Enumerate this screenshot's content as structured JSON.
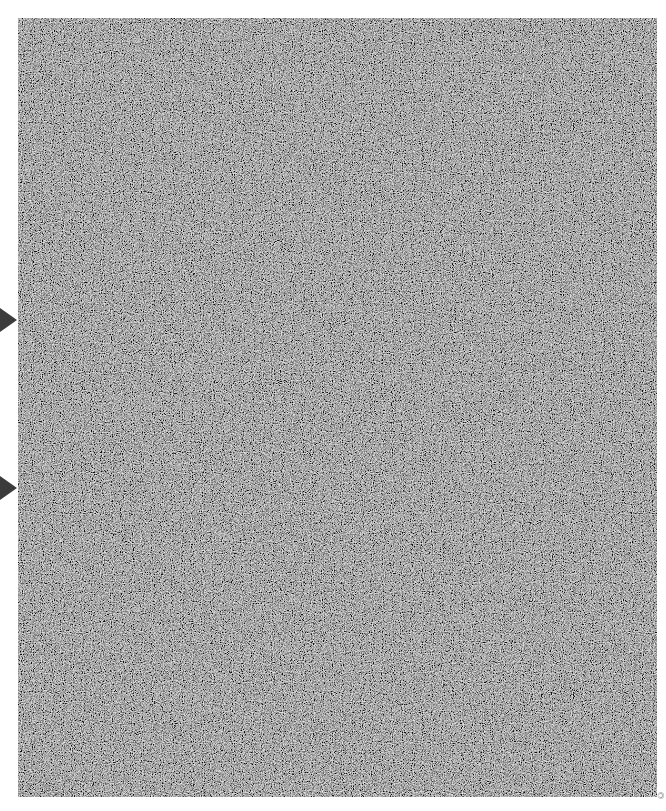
{
  "image": {
    "description": "Grayscale random-noise texture panel with two right-pointing markers on the left edge",
    "panel": {
      "fill_color": "#6a6a6a",
      "noise_light": "#d8d8d8",
      "noise_dark": "#2a2a2a"
    },
    "markers": [
      {
        "name": "upper-marker",
        "direction": "right",
        "y": 320,
        "color": "#3c3c3c"
      },
      {
        "name": "lower-marker",
        "direction": "right",
        "y": 488,
        "color": "#3c3c3c"
      }
    ],
    "edge_caption": "©"
  }
}
